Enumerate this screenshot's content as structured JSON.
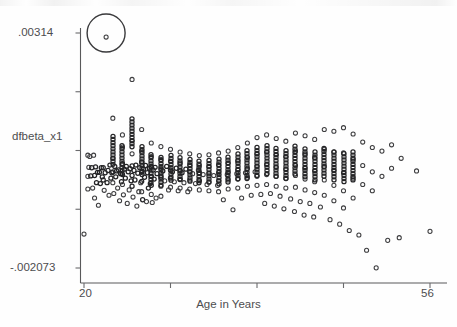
{
  "chart_data": {
    "type": "scatter",
    "title": "",
    "xlabel": "Age in Years",
    "ylabel": "dfbeta_x1",
    "xlim": [
      20,
      56
    ],
    "ylim": [
      -0.002073,
      0.00314
    ],
    "grid": false,
    "legend": null,
    "x_tick_labels": [
      "20",
      "56"
    ],
    "y_tick_labels": [
      ".00314",
      "-.002073"
    ],
    "x_tick_count": 5,
    "y_tick_count": 5,
    "marker": "open-circle",
    "annotations": [
      {
        "type": "highlight-circle",
        "label": "",
        "x": 22.3,
        "y": 0.00305,
        "radius_px": 19,
        "note": "large open circle drawn around a single high outlier point"
      }
    ],
    "points": [
      [
        20.0,
        -0.00132
      ],
      [
        20.4,
        0.00043
      ],
      [
        20.4,
        -4e-05
      ],
      [
        20.4,
        -0.00032
      ],
      [
        20.5,
        0.00016
      ],
      [
        20.6,
        0.0004
      ],
      [
        20.7,
        -3e-05
      ],
      [
        20.8,
        0.00015
      ],
      [
        20.9,
        -0.0003
      ],
      [
        21.0,
        0.00043
      ],
      [
        21.1,
        -2e-05
      ],
      [
        21.1,
        -0.00052
      ],
      [
        21.2,
        0.00017
      ],
      [
        21.3,
        -0.00018
      ],
      [
        21.4,
        5e-05
      ],
      [
        21.5,
        -0.00068
      ],
      [
        21.6,
        5e-05
      ],
      [
        21.7,
        -0.0002
      ],
      [
        21.8,
        0.00015
      ],
      [
        21.9,
        -5e-05
      ],
      [
        22.0,
        0.00015
      ],
      [
        22.0,
        -0.00012
      ],
      [
        22.1,
        -0.00035
      ],
      [
        22.2,
        4e-05
      ],
      [
        22.3,
        0.00305
      ],
      [
        22.4,
        -0.00018
      ],
      [
        22.5,
        9e-05
      ],
      [
        22.6,
        -0.00046
      ],
      [
        22.7,
        0.00021
      ],
      [
        22.8,
        -8e-05
      ],
      [
        22.9,
        4e-05
      ],
      [
        23.0,
        0.00125
      ],
      [
        23.0,
        0.00036
      ],
      [
        23.0,
        6e-05
      ],
      [
        23.0,
        -0.00018
      ],
      [
        23.1,
        -0.00042
      ],
      [
        23.2,
        0.00018
      ],
      [
        23.3,
        -5e-05
      ],
      [
        23.4,
        8e-05
      ],
      [
        23.5,
        -0.0003
      ],
      [
        23.6,
        0.0001
      ],
      [
        23.7,
        -0.00058
      ],
      [
        23.8,
        2e-05
      ],
      [
        23.9,
        -0.00016
      ],
      [
        24.0,
        0.00088
      ],
      [
        24.0,
        0.00061
      ],
      [
        24.0,
        0.00024
      ],
      [
        24.0,
        0.0
      ],
      [
        24.0,
        -0.00022
      ],
      [
        24.1,
        -0.00045
      ],
      [
        24.2,
        0.00012
      ],
      [
        24.3,
        -8e-05
      ],
      [
        24.4,
        0.00018
      ],
      [
        24.5,
        -0.00064
      ],
      [
        24.6,
        6e-05
      ],
      [
        24.7,
        -0.00034
      ],
      [
        24.8,
        0.00013
      ],
      [
        24.9,
        -0.00014
      ],
      [
        25.0,
        0.00211
      ],
      [
        25.0,
        0.00075
      ],
      [
        25.0,
        0.00046
      ],
      [
        25.0,
        0.00019
      ],
      [
        25.0,
        -2e-05
      ],
      [
        25.0,
        -0.00026
      ],
      [
        25.1,
        -0.0005
      ],
      [
        25.2,
        9e-05
      ],
      [
        25.3,
        -0.00012
      ],
      [
        25.4,
        0.00021
      ],
      [
        25.5,
        -0.0007
      ],
      [
        25.6,
        3e-05
      ],
      [
        25.7,
        -0.00038
      ],
      [
        25.8,
        0.00015
      ],
      [
        25.9,
        -0.00018
      ],
      [
        26.0,
        0.001
      ],
      [
        26.0,
        0.00052
      ],
      [
        26.0,
        0.00028
      ],
      [
        26.0,
        5e-05
      ],
      [
        26.0,
        -0.00015
      ],
      [
        26.0,
        -0.00038
      ],
      [
        26.1,
        -0.00056
      ],
      [
        26.2,
        0.00012
      ],
      [
        26.3,
        -6e-05
      ],
      [
        26.4,
        0.0002
      ],
      [
        26.5,
        -0.0006
      ],
      [
        26.6,
        4e-05
      ],
      [
        26.7,
        -0.0003
      ],
      [
        26.8,
        0.00014
      ],
      [
        26.9,
        -0.0002
      ],
      [
        27.0,
        0.0007
      ],
      [
        27.0,
        0.0004
      ],
      [
        27.0,
        0.00018
      ],
      [
        27.0,
        -4e-05
      ],
      [
        27.0,
        -0.00024
      ],
      [
        27.0,
        -0.00044
      ],
      [
        27.1,
        -0.00062
      ],
      [
        27.2,
        0.0001
      ],
      [
        27.3,
        -0.0001
      ],
      [
        27.4,
        0.00016
      ],
      [
        27.5,
        -0.00052
      ],
      [
        27.6,
        2e-05
      ],
      [
        28.0,
        0.00062
      ],
      [
        28.0,
        0.00034
      ],
      [
        28.0,
        0.00014
      ],
      [
        28.0,
        -6e-05
      ],
      [
        28.0,
        -0.00026
      ],
      [
        28.0,
        -0.00048
      ],
      [
        28.2,
        8e-05
      ],
      [
        28.4,
        -0.00014
      ],
      [
        28.6,
        0.00018
      ],
      [
        28.8,
        -0.00034
      ],
      [
        29.0,
        0.00056
      ],
      [
        29.0,
        0.0003
      ],
      [
        29.0,
        0.0001
      ],
      [
        29.0,
        -8e-05
      ],
      [
        29.0,
        -0.00028
      ],
      [
        29.2,
        6e-05
      ],
      [
        29.4,
        -0.00016
      ],
      [
        29.6,
        0.00014
      ],
      [
        29.8,
        -0.00036
      ],
      [
        30.0,
        0.0005
      ],
      [
        30.0,
        0.00026
      ],
      [
        30.0,
        8e-05
      ],
      [
        30.0,
        -0.0001
      ],
      [
        30.0,
        -0.0003
      ],
      [
        30.2,
        4e-05
      ],
      [
        30.4,
        -0.00018
      ],
      [
        30.6,
        0.00012
      ],
      [
        30.8,
        -0.00038
      ],
      [
        31.0,
        0.00046
      ],
      [
        31.0,
        0.00022
      ],
      [
        31.0,
        6e-05
      ],
      [
        31.0,
        -0.00012
      ],
      [
        31.0,
        -0.00032
      ],
      [
        31.3,
        2e-05
      ],
      [
        31.6,
        -0.0002
      ],
      [
        31.9,
        0.0001
      ],
      [
        32.0,
        0.00042
      ],
      [
        32.0,
        0.0002
      ],
      [
        32.0,
        4e-05
      ],
      [
        32.0,
        -0.00014
      ],
      [
        32.0,
        -0.00034
      ],
      [
        32.4,
        0.0
      ],
      [
        32.8,
        -0.00022
      ],
      [
        33.0,
        0.00044
      ],
      [
        33.0,
        0.00018
      ],
      [
        33.0,
        2e-05
      ],
      [
        33.0,
        -0.00016
      ],
      [
        33.0,
        -0.00036
      ],
      [
        33.5,
        -2e-05
      ],
      [
        33.9,
        -0.00024
      ],
      [
        34.0,
        0.00048
      ],
      [
        34.0,
        0.00022
      ],
      [
        34.0,
        4e-05
      ],
      [
        34.0,
        -0.00014
      ],
      [
        34.0,
        -0.00038
      ],
      [
        34.5,
        -0.00056
      ],
      [
        34.9,
        0.0
      ],
      [
        35.0,
        0.00052
      ],
      [
        35.0,
        0.00026
      ],
      [
        35.0,
        6e-05
      ],
      [
        35.0,
        -0.00012
      ],
      [
        35.0,
        -0.00032
      ],
      [
        35.5,
        -0.00078
      ],
      [
        35.9,
        2e-05
      ],
      [
        36.0,
        0.0006
      ],
      [
        36.0,
        0.0003
      ],
      [
        36.0,
        0.0001
      ],
      [
        36.0,
        -0.0001
      ],
      [
        36.0,
        -0.0003
      ],
      [
        36.4,
        -0.00052
      ],
      [
        36.8,
        4e-05
      ],
      [
        37.0,
        0.0007
      ],
      [
        37.0,
        0.00038
      ],
      [
        37.0,
        0.00014
      ],
      [
        37.0,
        -6e-05
      ],
      [
        37.0,
        -0.00026
      ],
      [
        37.4,
        -0.00046
      ],
      [
        37.8,
        6e-05
      ],
      [
        38.0,
        0.00082
      ],
      [
        38.0,
        0.00046
      ],
      [
        38.0,
        0.00018
      ],
      [
        38.0,
        -4e-05
      ],
      [
        38.0,
        -0.00024
      ],
      [
        38.4,
        -0.00044
      ],
      [
        38.8,
        -0.00064
      ],
      [
        39.0,
        0.00088
      ],
      [
        39.0,
        0.0005
      ],
      [
        39.0,
        0.00022
      ],
      [
        39.0,
        0.0
      ],
      [
        39.0,
        -0.00022
      ],
      [
        39.4,
        -0.00042
      ],
      [
        39.8,
        -0.0007
      ],
      [
        40.0,
        0.0008
      ],
      [
        40.0,
        0.00044
      ],
      [
        40.0,
        0.00016
      ],
      [
        40.0,
        -4e-05
      ],
      [
        40.0,
        -0.00026
      ],
      [
        40.4,
        -0.00048
      ],
      [
        40.8,
        -0.00076
      ],
      [
        41.0,
        0.00074
      ],
      [
        41.0,
        0.0004
      ],
      [
        41.0,
        0.00012
      ],
      [
        41.0,
        -8e-05
      ],
      [
        41.0,
        -0.0003
      ],
      [
        41.5,
        -0.00054
      ],
      [
        41.9,
        -0.00082
      ],
      [
        42.0,
        0.00092
      ],
      [
        42.0,
        0.00052
      ],
      [
        42.0,
        0.0002
      ],
      [
        42.0,
        -2e-05
      ],
      [
        42.0,
        -0.00028
      ],
      [
        42.5,
        -0.0006
      ],
      [
        42.9,
        -0.0009
      ],
      [
        43.0,
        0.00086
      ],
      [
        43.0,
        0.00046
      ],
      [
        43.0,
        0.00014
      ],
      [
        43.0,
        -0.0001
      ],
      [
        43.0,
        -0.00034
      ],
      [
        43.5,
        -0.00064
      ],
      [
        43.9,
        -0.00094
      ],
      [
        44.0,
        0.00078
      ],
      [
        44.0,
        0.00038
      ],
      [
        44.0,
        8e-05
      ],
      [
        44.0,
        -0.00016
      ],
      [
        44.0,
        -0.0004
      ],
      [
        44.6,
        -0.00072
      ],
      [
        45.0,
        0.001
      ],
      [
        45.0,
        0.00056
      ],
      [
        45.0,
        0.00018
      ],
      [
        45.0,
        -0.00012
      ],
      [
        45.0,
        -0.00046
      ],
      [
        45.6,
        -0.001
      ],
      [
        46.0,
        0.00096
      ],
      [
        46.0,
        0.0005
      ],
      [
        46.0,
        0.0001
      ],
      [
        46.0,
        -0.00024
      ],
      [
        46.0,
        -0.00058
      ],
      [
        46.6,
        -0.0011
      ],
      [
        47.0,
        0.00104
      ],
      [
        47.0,
        0.00048
      ],
      [
        47.0,
        4e-05
      ],
      [
        47.0,
        -0.00036
      ],
      [
        47.0,
        -0.00074
      ],
      [
        47.6,
        -0.00124
      ],
      [
        48.0,
        0.0009
      ],
      [
        48.0,
        0.00034
      ],
      [
        48.0,
        -8e-05
      ],
      [
        48.0,
        -0.00052
      ],
      [
        48.6,
        -0.00134
      ],
      [
        49.0,
        0.00072
      ],
      [
        49.0,
        0.0002
      ],
      [
        49.0,
        -0.00022
      ],
      [
        49.4,
        -0.00168
      ],
      [
        50.0,
        0.0006
      ],
      [
        50.0,
        6e-05
      ],
      [
        50.0,
        -0.00036
      ],
      [
        50.4,
        -0.00207
      ],
      [
        51.0,
        0.00052
      ],
      [
        51.0,
        -4e-05
      ],
      [
        51.6,
        -0.00146
      ],
      [
        52.0,
        0.00066
      ],
      [
        52.0,
        0.00014
      ],
      [
        52.8,
        -0.0014
      ],
      [
        53.0,
        0.00036
      ],
      [
        54.6,
        8e-05
      ],
      [
        56.0,
        -0.00126
      ]
    ]
  },
  "axis": {
    "y_top_label": ".00314",
    "y_bottom_label": "-.002073",
    "y_title": "dfbeta_x1",
    "x_left_label": "20",
    "x_right_label": "56",
    "x_title": "Age in Years"
  },
  "colors": {
    "background": "#fefefe",
    "axis": "#58585a",
    "marker": "#3d3d3f",
    "marker_dense": "#242426",
    "text": "#4d4d4f",
    "annotation": "#3a3a3c"
  }
}
